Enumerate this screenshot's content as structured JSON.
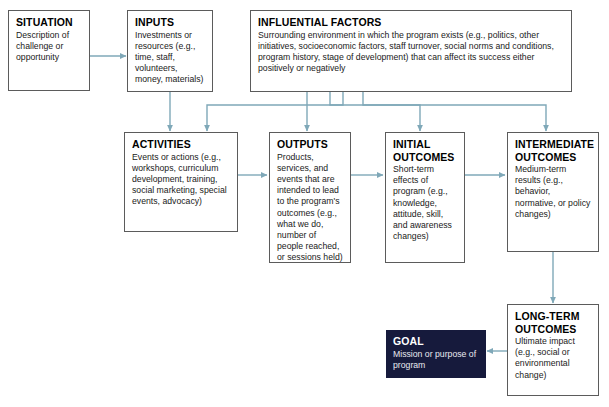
{
  "diagram": {
    "accent_color": "#7fa8b8",
    "box_border_color": "#5b5b5b",
    "goal_fill_color": "#161a3c",
    "background_color": "#ffffff"
  },
  "boxes": [
    {
      "id": "situation",
      "title": "SITUATION",
      "body": "Description of challenge or opportunity"
    },
    {
      "id": "inputs",
      "title": "INPUTS",
      "body": "Investments or resources (e.g., time, staff, volunteers, money, materials)"
    },
    {
      "id": "influential-factors",
      "title": "INFLUENTIAL FACTORS",
      "body": "Surrounding environment in which the program exists (e.g., politics, other initiatives, socioeconomic factors, staff turnover, social norms and conditions, program history, stage of development) that can affect its success either positively or negatively"
    },
    {
      "id": "activities",
      "title": "ACTIVITIES",
      "body": "Events or actions (e.g., workshops, curriculum development, training, social marketing, special events, advocacy)"
    },
    {
      "id": "outputs",
      "title": "OUTPUTS",
      "body": "Products, services, and events that are intended to lead to the program's outcomes (e.g., what we do, number of people reached, or sessions held)"
    },
    {
      "id": "initial-outcomes",
      "title": "INITIAL\nOUTCOMES",
      "body": "Short-term effects of program (e.g., knowledge, attitude, skill, and awareness changes)"
    },
    {
      "id": "intermediate-outcomes",
      "title": "INTERMEDIATE\nOUTCOMES",
      "body": "Medium-term results (e.g., behavior, normative, or policy changes)"
    },
    {
      "id": "long-term-outcomes",
      "title": "LONG-TERM\nOUTCOMES",
      "body": "Ultimate impact (e.g., social or environmental change)"
    },
    {
      "id": "goal",
      "title": "GOAL",
      "body": "Mission or purpose of program"
    }
  ],
  "connectors": [
    {
      "from": "situation",
      "to": "inputs",
      "kind": "arrow-right"
    },
    {
      "from": "inputs",
      "to": "activities",
      "kind": "arrow-down"
    },
    {
      "from": "activities",
      "to": "outputs",
      "kind": "arrow-right"
    },
    {
      "from": "outputs",
      "to": "initial-outcomes",
      "kind": "arrow-right"
    },
    {
      "from": "initial-outcomes",
      "to": "intermediate-outcomes",
      "kind": "arrow-right"
    },
    {
      "from": "influential-factors",
      "to": "activities",
      "kind": "elbow-down-left"
    },
    {
      "from": "influential-factors",
      "to": "outputs",
      "kind": "arrow-down"
    },
    {
      "from": "influential-factors",
      "to": "initial-outcomes",
      "kind": "elbow-down"
    },
    {
      "from": "influential-factors",
      "to": "intermediate-outcomes",
      "kind": "elbow-down-right"
    },
    {
      "from": "intermediate-outcomes",
      "to": "long-term-outcomes",
      "kind": "arrow-down"
    },
    {
      "from": "long-term-outcomes",
      "to": "goal",
      "kind": "arrow-left"
    }
  ]
}
